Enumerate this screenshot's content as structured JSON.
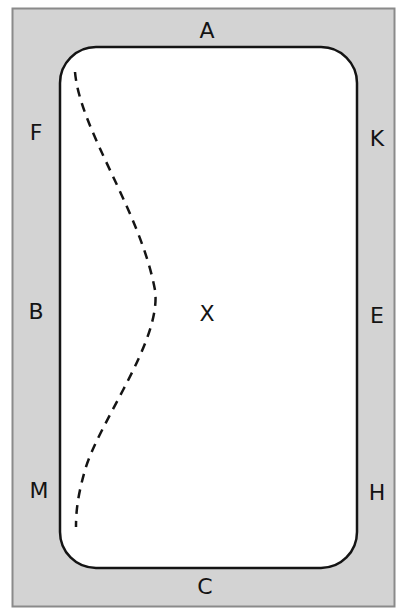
{
  "diagram": {
    "colors": {
      "surround": "#d3d3d3",
      "surround_border": "#8a8a8a",
      "arena_fill": "#ffffff",
      "arena_border": "#141414",
      "track": "#141414",
      "letters": "#141414"
    },
    "markers": [
      {
        "label": "A",
        "x": 207,
        "y": 31
      },
      {
        "label": "F",
        "x": 36,
        "y": 133
      },
      {
        "label": "K",
        "x": 377,
        "y": 139
      },
      {
        "label": "B",
        "x": 36,
        "y": 312
      },
      {
        "label": "X",
        "x": 207,
        "y": 314
      },
      {
        "label": "E",
        "x": 377,
        "y": 316
      },
      {
        "label": "M",
        "x": 39,
        "y": 491
      },
      {
        "label": "H",
        "x": 377,
        "y": 493
      },
      {
        "label": "C",
        "x": 205,
        "y": 587
      }
    ],
    "track": {
      "style": "dashed",
      "description": "Shallow loop from near F curving toward X at B-level and returning near M"
    }
  }
}
